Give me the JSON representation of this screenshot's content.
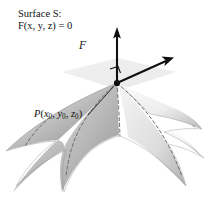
{
  "figure": {
    "background_color": "#ffffff",
    "width": 208,
    "height": 197
  },
  "labels": {
    "surface_line1": "Surface S:",
    "surface_line1_prefix": "Surface ",
    "surface_line1_symbol": "S",
    "surface_line1_suffix": ":",
    "surface_line2": "F(x, y, z) = 0",
    "surface_function_name": "F",
    "surface_function_args": "(x, y, z)",
    "surface_function_equals": " = 0",
    "normal_vector": "F",
    "point_name": "P",
    "point_open": "(",
    "point_x": "x",
    "point_x_sub": "0",
    "point_sep1": ", ",
    "point_y": "y",
    "point_y_sub": "0",
    "point_sep2": ", ",
    "point_z": "z",
    "point_z_sub": "0",
    "point_close": ")"
  },
  "geometry": {
    "point_P": {
      "x": 117,
      "y": 83
    },
    "normal_arrow_tip": {
      "x": 117,
      "y": 30
    },
    "tangent_arrow_tip": {
      "x": 172,
      "y": 58
    },
    "right_angle_marker": {
      "x": 120,
      "y": 66
    },
    "dashed_curve_count": 7,
    "surface_type": "saddle",
    "tangent_plane_visible": true
  },
  "colors": {
    "ink": "#111111",
    "surface_light": "#f4f4f4",
    "surface_mid": "#c9c9c9",
    "surface_dark": "#9a9a9a",
    "surface_edge": "#7d7d7d",
    "dashed_curve": "#6e6e6e",
    "tangent_plane": "#d8d8d8",
    "arrow": "#101010"
  }
}
